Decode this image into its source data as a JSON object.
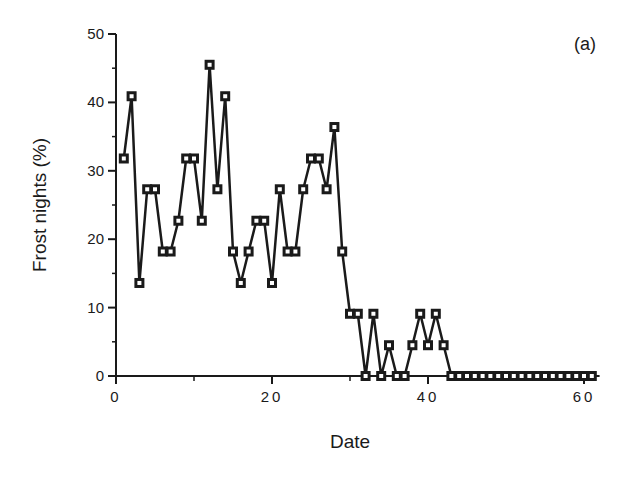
{
  "chart_data": {
    "type": "line",
    "title": "",
    "panel_label": "(a)",
    "xlabel": "Date",
    "ylabel": "Frost nights (%)",
    "xlim": [
      0,
      62
    ],
    "ylim": [
      0,
      50
    ],
    "xticks": [
      0,
      20,
      40,
      60
    ],
    "yticks": [
      0,
      10,
      20,
      30,
      40,
      50
    ],
    "x_minor_ticks": [
      10,
      30,
      50
    ],
    "y_minor_ticks": [
      5,
      15,
      25,
      35,
      45
    ],
    "marker": "square",
    "grid": false,
    "legend": null,
    "x": [
      1,
      2,
      3,
      4,
      5,
      6,
      7,
      8,
      9,
      10,
      11,
      12,
      13,
      14,
      15,
      16,
      17,
      18,
      19,
      20,
      21,
      22,
      23,
      24,
      25,
      26,
      27,
      28,
      29,
      30,
      31,
      32,
      33,
      34,
      35,
      36,
      37,
      38,
      39,
      40,
      41,
      42,
      43,
      44,
      45,
      46,
      47,
      48,
      49,
      50,
      51,
      52,
      53,
      54,
      55,
      56,
      57,
      58,
      59,
      60,
      61
    ],
    "values": [
      31.8,
      40.9,
      13.6,
      27.3,
      27.3,
      18.2,
      18.2,
      22.7,
      31.8,
      31.8,
      22.7,
      45.5,
      27.3,
      40.9,
      18.2,
      13.6,
      18.2,
      22.7,
      22.7,
      13.6,
      27.3,
      18.2,
      18.2,
      27.3,
      31.8,
      31.8,
      27.3,
      36.4,
      18.2,
      9.1,
      9.1,
      0,
      9.1,
      0,
      4.5,
      0,
      0,
      4.5,
      9.1,
      4.5,
      9.1,
      4.5,
      0,
      0,
      0,
      0,
      0,
      0,
      0,
      0,
      0,
      0,
      0,
      0,
      0,
      0,
      0,
      0,
      0,
      0,
      0
    ]
  },
  "colors": {
    "line": "#1a1a1a",
    "background": "#ffffff"
  }
}
